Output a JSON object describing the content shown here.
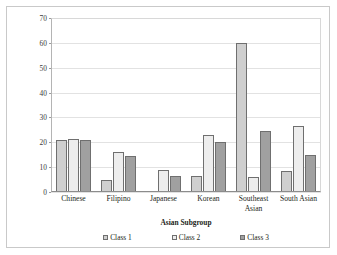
{
  "chart_data": {
    "type": "bar",
    "title": "",
    "xlabel": "Asian Subgroup",
    "ylabel": "Percentage of Class",
    "categories": [
      "Chinese",
      "Filipino",
      "Japanese",
      "Korean",
      "Southeast Asian",
      "South Asian"
    ],
    "series": [
      {
        "name": "Class 1",
        "values": [
          20.8,
          4.8,
          0.3,
          6.6,
          60.0,
          8.6
        ],
        "color": "#cfcfcf"
      },
      {
        "name": "Class 2",
        "values": [
          21.4,
          16.2,
          8.8,
          22.8,
          6.1,
          26.6
        ],
        "color": "#ededed"
      },
      {
        "name": "Class 3",
        "values": [
          20.8,
          14.6,
          6.6,
          20.3,
          24.5,
          15.0
        ],
        "color": "#a0a0a0"
      }
    ],
    "ylim": [
      0,
      70
    ],
    "yticks": [
      0,
      10,
      20,
      30,
      40,
      50,
      60,
      70
    ],
    "ytick_labels": [
      "0",
      "10",
      "20",
      "30",
      "40",
      "50",
      "60",
      "70"
    ],
    "grid": true,
    "legend_position": "bottom"
  }
}
